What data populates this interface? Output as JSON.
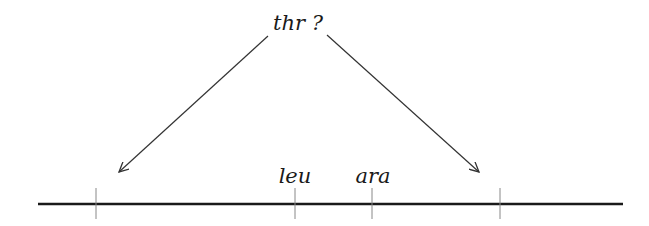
{
  "diagram": {
    "question_label": "thr ?",
    "markers": [
      {
        "label": "leu",
        "x": 295
      },
      {
        "label": "ara",
        "x": 372
      }
    ],
    "ticks": [
      96,
      295,
      372,
      500
    ],
    "candidate_positions": [
      "left",
      "right"
    ],
    "colors": {
      "line": "#1a1a1a",
      "tick": "#888888",
      "arrow": "#333333"
    }
  }
}
